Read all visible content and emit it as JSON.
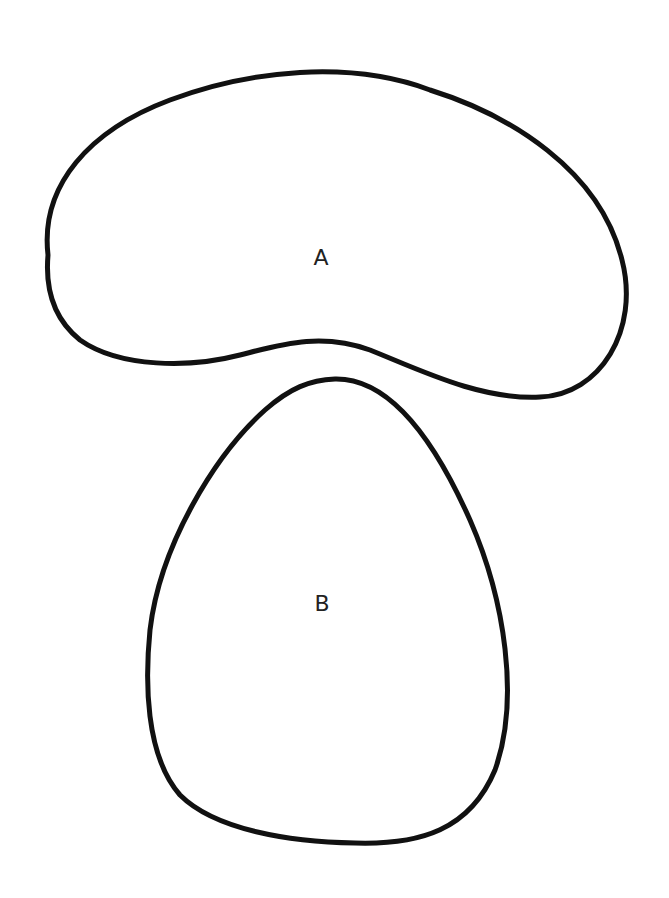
{
  "diagram": {
    "shapes": [
      {
        "id": "A",
        "label": "A",
        "description": "kidney-shaped region"
      },
      {
        "id": "B",
        "label": "B",
        "description": "egg-shaped region"
      }
    ],
    "stroke_color": "#111111",
    "background_color": "#ffffff"
  }
}
